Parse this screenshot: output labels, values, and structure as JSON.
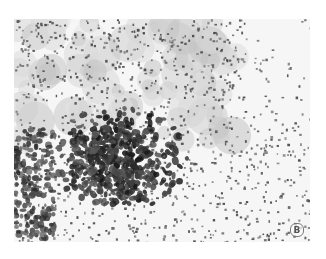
{
  "figure": {
    "type": "grayscale-micrograph",
    "panel_label": "B",
    "tones": {
      "background": "#ffffff",
      "cell_cluster": "#2a2a2a",
      "scattered_cells": "#555555",
      "light_stroma": "#cfcfcf"
    }
  }
}
